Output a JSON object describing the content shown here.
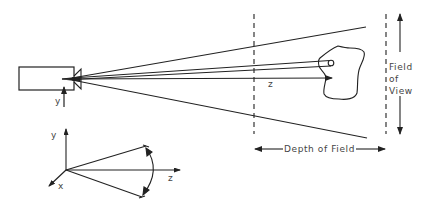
{
  "diagram": {
    "type": "camera-field-of-view",
    "colors": {
      "stroke": "#222222",
      "text": "#444444",
      "background": "#ffffff"
    },
    "labels": {
      "camera_y_axis": "y",
      "z_axis": "z",
      "field_of_view_line1": "Field",
      "field_of_view_line2": "of",
      "field_of_view_line3": "View",
      "depth_of_field": "Depth of Field",
      "frame_y": "y",
      "frame_z": "z",
      "frame_x": "x"
    },
    "elements": [
      "camera-body",
      "camera-lens",
      "view-cone",
      "sight-ray-tube",
      "optical-axis-z",
      "object-blob",
      "near-depth-boundary",
      "far-depth-boundary",
      "field-of-view-arrows",
      "depth-of-field-arrows",
      "coordinate-frame"
    ]
  }
}
